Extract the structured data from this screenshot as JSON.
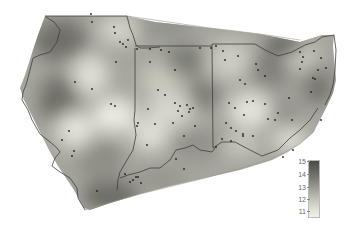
{
  "map": {
    "title": "",
    "region_states": [
      "Illinois",
      "Indiana",
      "Ohio"
    ],
    "colors": {
      "background": "#ffffff",
      "surface_dark": "#4f4f4b",
      "surface_light": "#efefe6",
      "boundary": "#3e3e3e",
      "station": "#222222"
    },
    "stations": [
      [
        91,
        14
      ],
      [
        92,
        22
      ],
      [
        114,
        27
      ],
      [
        115,
        33
      ],
      [
        120,
        42
      ],
      [
        123,
        44
      ],
      [
        126,
        47
      ],
      [
        128,
        40
      ],
      [
        116,
        62
      ],
      [
        75,
        82
      ],
      [
        92,
        89
      ],
      [
        111,
        104
      ],
      [
        115,
        106
      ],
      [
        137,
        49
      ],
      [
        150,
        49
      ],
      [
        161,
        50
      ],
      [
        169,
        52
      ],
      [
        150,
        62
      ],
      [
        175,
        70
      ],
      [
        200,
        48
      ],
      [
        211,
        48
      ],
      [
        216,
        46
      ],
      [
        223,
        51
      ],
      [
        225,
        60
      ],
      [
        238,
        56
      ],
      [
        240,
        80
      ],
      [
        245,
        84
      ],
      [
        256,
        64
      ],
      [
        258,
        70
      ],
      [
        265,
        76
      ],
      [
        300,
        52
      ],
      [
        302,
        62
      ],
      [
        303,
        57
      ],
      [
        314,
        51
      ],
      [
        321,
        58
      ],
      [
        300,
        69
      ],
      [
        318,
        70
      ],
      [
        326,
        68
      ],
      [
        313,
        78
      ],
      [
        311,
        92
      ],
      [
        315,
        79
      ],
      [
        158,
        90
      ],
      [
        165,
        95
      ],
      [
        175,
        103
      ],
      [
        178,
        111
      ],
      [
        180,
        106
      ],
      [
        182,
        116
      ],
      [
        187,
        105
      ],
      [
        190,
        109
      ],
      [
        193,
        108
      ],
      [
        189,
        112
      ],
      [
        195,
        126
      ],
      [
        173,
        123
      ],
      [
        184,
        136
      ],
      [
        148,
        109
      ],
      [
        155,
        124
      ],
      [
        138,
        123
      ],
      [
        147,
        145
      ],
      [
        137,
        126
      ],
      [
        229,
        103
      ],
      [
        235,
        108
      ],
      [
        247,
        102
      ],
      [
        244,
        115
      ],
      [
        253,
        101
      ],
      [
        265,
        104
      ],
      [
        268,
        119
      ],
      [
        275,
        120
      ],
      [
        226,
        123
      ],
      [
        231,
        128
      ],
      [
        243,
        134
      ],
      [
        222,
        139
      ],
      [
        231,
        141
      ],
      [
        243,
        136
      ],
      [
        253,
        136
      ],
      [
        278,
        113
      ],
      [
        289,
        98
      ],
      [
        292,
        120
      ],
      [
        321,
        120
      ],
      [
        283,
        157
      ],
      [
        293,
        150
      ],
      [
        69,
        131
      ],
      [
        74,
        151
      ],
      [
        72,
        156
      ],
      [
        62,
        140
      ],
      [
        125,
        174
      ],
      [
        133,
        180
      ],
      [
        136,
        177
      ],
      [
        130,
        182
      ],
      [
        141,
        183
      ],
      [
        138,
        177
      ],
      [
        97,
        191
      ],
      [
        176,
        159
      ],
      [
        184,
        169
      ],
      [
        216,
        147
      ],
      [
        236,
        131
      ]
    ],
    "legend": {
      "ticks": [
        "15",
        "14",
        "13",
        "12",
        "11"
      ],
      "min": 11,
      "max": 15
    }
  }
}
